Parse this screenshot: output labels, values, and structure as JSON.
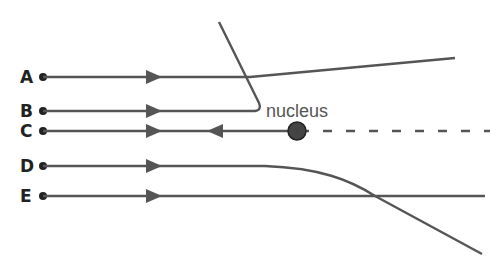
{
  "diagram": {
    "nucleus_label": "nucleus",
    "colors": {
      "line": "#555555",
      "nucleus": "#444444",
      "label": "#222222"
    },
    "paths": [
      {
        "id": "A",
        "label": "A",
        "y": 77,
        "description": "slightly deflected upward"
      },
      {
        "id": "B",
        "label": "B",
        "y": 111,
        "description": "deflected sharply upward-back"
      },
      {
        "id": "C",
        "label": "C",
        "y": 131,
        "description": "head-on, reflected straight back"
      },
      {
        "id": "D",
        "label": "D",
        "y": 166,
        "description": "deflected downward"
      },
      {
        "id": "E",
        "label": "E",
        "y": 196,
        "description": "undeflected"
      }
    ]
  }
}
